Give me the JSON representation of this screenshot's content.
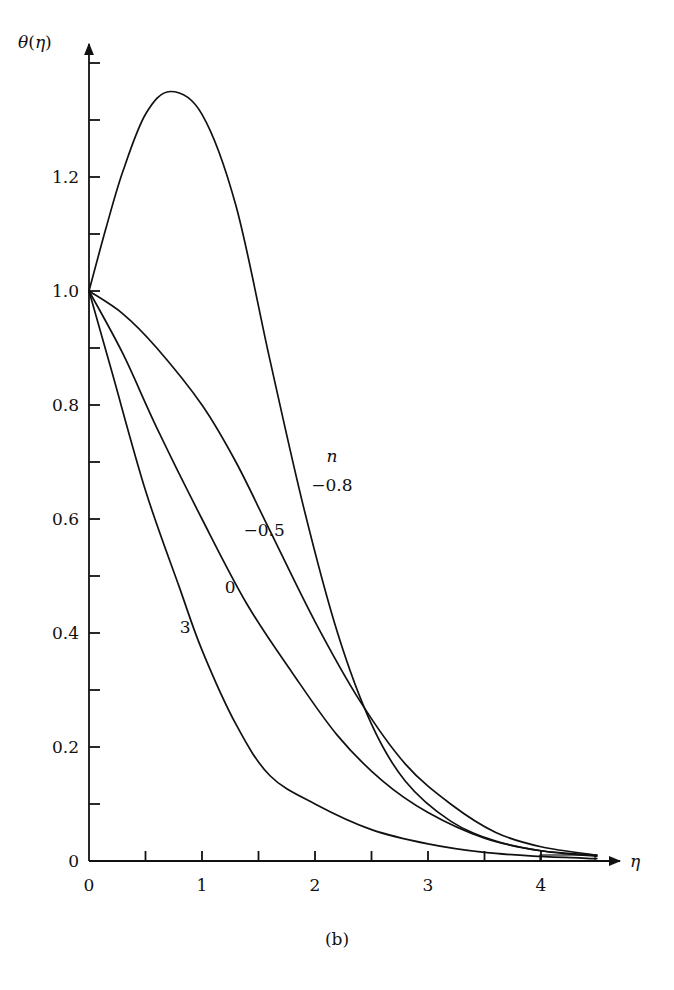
{
  "chart_data": {
    "type": "line",
    "title": "",
    "caption": "(b)",
    "xlabel": "η",
    "ylabel": "θ(η)",
    "xlim": [
      0,
      4.5
    ],
    "ylim": [
      0,
      1.4
    ],
    "grid": false,
    "x_ticks": [
      0,
      0.5,
      1,
      1.5,
      2,
      2.5,
      3,
      3.5,
      4
    ],
    "x_tick_labels": [
      "0",
      "1",
      "2",
      "3",
      "4"
    ],
    "y_ticks": [
      0,
      0.1,
      0.2,
      0.3,
      0.4,
      0.5,
      0.6,
      0.7,
      0.8,
      0.9,
      1.0,
      1.1,
      1.2,
      1.3,
      1.4
    ],
    "y_tick_labels": [
      "0",
      "0.2",
      "0.4",
      "0.6",
      "0.8",
      "1.0",
      "1.2"
    ],
    "legend_title": "n",
    "series": [
      {
        "name": "-0.8",
        "label": "−0.8",
        "x": [
          0,
          0.15,
          0.3,
          0.5,
          0.72,
          1.0,
          1.3,
          1.6,
          1.9,
          2.2,
          2.5,
          2.8,
          3.2,
          3.6,
          4.0,
          4.5
        ],
        "y": [
          1.0,
          1.11,
          1.21,
          1.31,
          1.35,
          1.31,
          1.15,
          0.88,
          0.62,
          0.4,
          0.24,
          0.14,
          0.07,
          0.035,
          0.018,
          0.01
        ]
      },
      {
        "name": "-0.5",
        "label": "−0.5",
        "x": [
          0,
          0.3,
          0.6,
          1.0,
          1.3,
          1.6,
          2.0,
          2.4,
          2.8,
          3.2,
          3.6,
          4.0,
          4.5
        ],
        "y": [
          1.0,
          0.96,
          0.9,
          0.8,
          0.7,
          0.58,
          0.42,
          0.28,
          0.17,
          0.1,
          0.05,
          0.025,
          0.01
        ]
      },
      {
        "name": "0",
        "label": "0",
        "x": [
          0,
          0.3,
          0.6,
          1.0,
          1.4,
          1.8,
          2.2,
          2.6,
          3.0,
          3.5,
          4.0,
          4.5
        ],
        "y": [
          1.0,
          0.89,
          0.76,
          0.6,
          0.45,
          0.33,
          0.22,
          0.14,
          0.085,
          0.04,
          0.018,
          0.008
        ]
      },
      {
        "name": "3",
        "label": "3",
        "x": [
          0,
          0.2,
          0.5,
          0.8,
          1.0,
          1.3,
          1.6,
          2.0,
          2.5,
          3.0,
          3.5,
          4.0,
          4.5
        ],
        "y": [
          1.0,
          0.86,
          0.65,
          0.48,
          0.37,
          0.24,
          0.15,
          0.1,
          0.055,
          0.03,
          0.015,
          0.008,
          0.004
        ]
      }
    ],
    "annotations": [
      {
        "text": "n",
        "x": 2.15,
        "y": 0.7
      },
      {
        "text": "−0.8",
        "x": 2.15,
        "y": 0.65
      },
      {
        "text": "−0.5",
        "x": 1.55,
        "y": 0.57
      },
      {
        "text": "0",
        "x": 1.25,
        "y": 0.47
      },
      {
        "text": "3",
        "x": 0.85,
        "y": 0.4
      }
    ]
  },
  "plot": {
    "origin_px": [
      89,
      861
    ],
    "px_per_x": 113,
    "px_per_y": 570
  }
}
